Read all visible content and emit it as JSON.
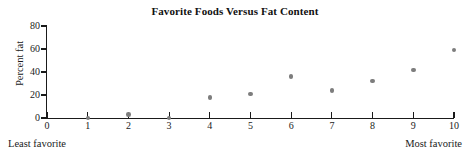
{
  "chart_data": {
    "type": "scatter",
    "title": "Favorite Foods Versus Fat Content",
    "xlabel": "",
    "ylabel": "Percent fat",
    "x": [
      1,
      2,
      3,
      4,
      5,
      6,
      7,
      8,
      9,
      10
    ],
    "values": [
      0,
      3,
      0,
      18,
      21,
      36,
      24,
      32,
      42,
      59
    ],
    "series": [
      {
        "name": "Favorite food rating vs percent fat",
        "points": [
          {
            "x": 1,
            "y": 0
          },
          {
            "x": 2,
            "y": 3
          },
          {
            "x": 3,
            "y": 0
          },
          {
            "x": 4,
            "y": 18
          },
          {
            "x": 5,
            "y": 21
          },
          {
            "x": 6,
            "y": 36
          },
          {
            "x": 7,
            "y": 24
          },
          {
            "x": 8,
            "y": 32
          },
          {
            "x": 9,
            "y": 42
          },
          {
            "x": 10,
            "y": 59
          }
        ]
      }
    ],
    "xlim": [
      0,
      10
    ],
    "ylim": [
      0,
      80
    ],
    "x_ticks": [
      "0",
      "1",
      "2",
      "3",
      "4",
      "5",
      "6",
      "7",
      "8",
      "9",
      "10"
    ],
    "x_tick_values": [
      0,
      1,
      2,
      3,
      4,
      5,
      6,
      7,
      8,
      9,
      10
    ],
    "y_ticks": [
      "0",
      "20",
      "40",
      "60",
      "80"
    ],
    "y_tick_values": [
      0,
      20,
      40,
      60,
      80
    ],
    "grid": false,
    "legend": false,
    "annotations": {
      "left_endpoint": "Least favorite",
      "right_endpoint": "Most favorite"
    },
    "marker_color": "#7d7d7d",
    "axis_color": "#1a1a1a"
  }
}
